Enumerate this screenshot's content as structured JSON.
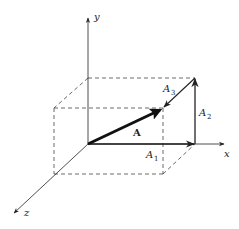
{
  "diagram": {
    "axes": {
      "x_label": "x",
      "y_label": "y",
      "z_label": "z"
    },
    "vectors": {
      "main": {
        "label": "A"
      },
      "components": [
        {
          "label_base": "A",
          "label_sub": "1"
        },
        {
          "label_base": "A",
          "label_sub": "2"
        },
        {
          "label_base": "A",
          "label_sub": "3"
        }
      ]
    },
    "colors": {
      "line": "#222222",
      "dashed": "#444444",
      "background": "#ffffff"
    }
  }
}
